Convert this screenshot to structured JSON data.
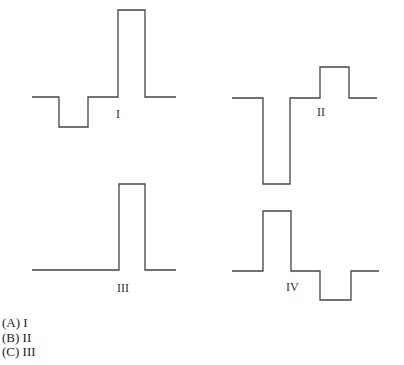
{
  "figures": [
    {
      "id": "I",
      "label": "I",
      "path": "32,97 59,97 59,127 88,127 88,97 118,97 118,10 145,10 145,97 176,97",
      "label_pos": [
        116,
        108
      ]
    },
    {
      "id": "II",
      "label": "II",
      "path": "232,98 263,98 263,184 290,184 290,98 320,98 320,67 349,67 349,98 377,98",
      "label_pos": [
        317,
        106
      ]
    },
    {
      "id": "III",
      "label": "III",
      "path": "32,270 119,270 119,184 145,184 145,270 176,270",
      "label_pos": [
        117,
        282
      ]
    },
    {
      "id": "IV",
      "label": "IV",
      "path": "232,271 263,271 263,211 291,211 291,271 320,271 320,300 351,300 351,271 379,271",
      "label_pos": [
        286,
        281
      ]
    }
  ],
  "options": [
    {
      "letter": "(A)",
      "text": "I",
      "full": "(A) I"
    },
    {
      "letter": "(B)",
      "text": "II",
      "full": "(B) II"
    },
    {
      "letter": "(C)",
      "text": "III",
      "full": "(C) III"
    }
  ],
  "style": {
    "stroke": "#444444"
  }
}
